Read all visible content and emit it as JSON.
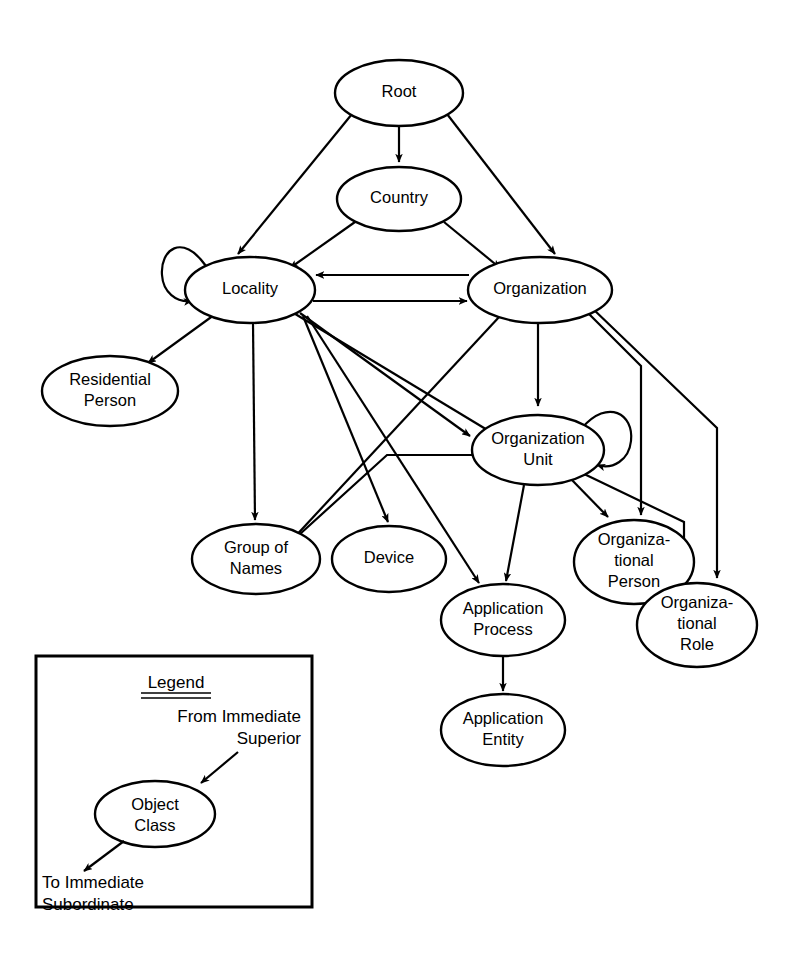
{
  "diagram": {
    "background_color": "#ffffff",
    "line_color": "#000000",
    "node_fill_color": "#ffffff",
    "nodes": [
      {
        "id": "root",
        "label": "Root",
        "lines": [
          "Root"
        ],
        "cx": 399,
        "cy": 93,
        "rx": 64,
        "ry": 33
      },
      {
        "id": "country",
        "label": "Country",
        "lines": [
          "Country"
        ],
        "cx": 399,
        "cy": 199,
        "rx": 62,
        "ry": 32
      },
      {
        "id": "locality",
        "label": "Locality",
        "lines": [
          "Locality"
        ],
        "cx": 250,
        "cy": 290,
        "rx": 65,
        "ry": 33
      },
      {
        "id": "organization",
        "label": "Organization",
        "lines": [
          "Organization"
        ],
        "cx": 540,
        "cy": 290,
        "rx": 72,
        "ry": 33
      },
      {
        "id": "resperson",
        "label": "Residential Person",
        "lines": [
          "Residential",
          "Person"
        ],
        "cx": 110,
        "cy": 391,
        "rx": 68,
        "ry": 35
      },
      {
        "id": "orgunit",
        "label": "Organization Unit",
        "lines": [
          "Organization",
          "Unit"
        ],
        "cx": 538,
        "cy": 450,
        "rx": 66,
        "ry": 35
      },
      {
        "id": "groupnames",
        "label": "Group of Names",
        "lines": [
          "Group of",
          "Names"
        ],
        "cx": 256,
        "cy": 559,
        "rx": 64,
        "ry": 35
      },
      {
        "id": "device",
        "label": "Device",
        "lines": [
          "Device"
        ],
        "cx": 389,
        "cy": 559,
        "rx": 57,
        "ry": 33
      },
      {
        "id": "orgperson",
        "label": "Organizational Person",
        "lines": [
          "Organiza-",
          "tional",
          "Person"
        ],
        "cx": 634,
        "cy": 562,
        "rx": 60,
        "ry": 42
      },
      {
        "id": "appprocess",
        "label": "Application Process",
        "lines": [
          "Application",
          "Process"
        ],
        "cx": 503,
        "cy": 620,
        "rx": 62,
        "ry": 36
      },
      {
        "id": "orgrole",
        "label": "Organizational Role",
        "lines": [
          "Organiza-",
          "tional",
          "Role"
        ],
        "cx": 697,
        "cy": 625,
        "rx": 60,
        "ry": 42
      },
      {
        "id": "appentity",
        "label": "Application Entity",
        "lines": [
          "Application",
          "Entity"
        ],
        "cx": 503,
        "cy": 730,
        "rx": 62,
        "ry": 36
      }
    ],
    "edges": [
      {
        "from": "root",
        "to": "locality",
        "type": "straight"
      },
      {
        "from": "root",
        "to": "country",
        "type": "straight"
      },
      {
        "from": "root",
        "to": "organization",
        "type": "straight"
      },
      {
        "from": "country",
        "to": "locality",
        "type": "straight"
      },
      {
        "from": "country",
        "to": "organization",
        "type": "straight"
      },
      {
        "from": "locality",
        "to": "locality",
        "type": "self-loop"
      },
      {
        "from": "locality",
        "to": "organization",
        "type": "straight"
      },
      {
        "from": "organization",
        "to": "locality",
        "type": "straight"
      },
      {
        "from": "locality",
        "to": "resperson",
        "type": "straight"
      },
      {
        "from": "locality",
        "to": "groupnames",
        "type": "straight"
      },
      {
        "from": "locality",
        "to": "orgunit",
        "type": "straight"
      },
      {
        "from": "locality",
        "to": "device",
        "type": "straight"
      },
      {
        "from": "locality",
        "to": "appprocess",
        "type": "straight"
      },
      {
        "from": "organization",
        "to": "orgunit",
        "type": "straight"
      },
      {
        "from": "organization",
        "to": "groupnames",
        "type": "straight"
      },
      {
        "from": "organization",
        "to": "orgperson",
        "type": "orthogonal"
      },
      {
        "from": "organization",
        "to": "orgrole",
        "type": "orthogonal"
      },
      {
        "from": "orgunit",
        "to": "orgunit",
        "type": "self-loop"
      },
      {
        "from": "orgunit",
        "to": "locality",
        "type": "straight"
      },
      {
        "from": "orgunit",
        "to": "groupnames",
        "type": "orthogonal"
      },
      {
        "from": "orgunit",
        "to": "appprocess",
        "type": "straight"
      },
      {
        "from": "orgunit",
        "to": "orgperson",
        "type": "straight"
      },
      {
        "from": "orgunit",
        "to": "orgrole",
        "type": "orthogonal"
      },
      {
        "from": "appprocess",
        "to": "appentity",
        "type": "straight"
      }
    ]
  },
  "legend": {
    "title": "Legend",
    "from_label_line1": "From Immediate",
    "from_label_line2": "Superior",
    "object_class_line1": "Object",
    "object_class_line2": "Class",
    "to_label_line1": "To Immediate",
    "to_label_line2": "Subordinate"
  }
}
